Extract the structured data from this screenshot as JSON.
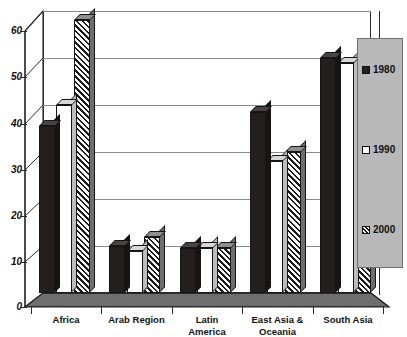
{
  "chart_data": {
    "type": "bar",
    "title": "",
    "subtitle": "",
    "xlabel": "",
    "ylabel": "",
    "ylim": [
      0,
      60
    ],
    "ytick_values": [
      0,
      10,
      20,
      30,
      40,
      50,
      60
    ],
    "ytick_labels": [
      "0",
      "10",
      "20",
      "30",
      "40",
      "50",
      "60"
    ],
    "grid": true,
    "legend_position": "right",
    "categories": [
      "Africa",
      "Arab Region",
      "Latin America",
      "East Asia & Oceania",
      "South Asia"
    ],
    "category_lines": [
      [
        "Africa"
      ],
      [
        "Arab Region"
      ],
      [
        "Latin",
        "America"
      ],
      [
        "East Asia &",
        "Oceania"
      ],
      [
        "South Asia"
      ]
    ],
    "series": [
      {
        "name": "1980",
        "values": [
          35.5,
          10,
          9.5,
          38.5,
          50
        ],
        "fill": "dark-dotted",
        "color": "#241f1f"
      },
      {
        "name": "1990",
        "values": [
          40,
          9,
          9.5,
          28,
          49
        ],
        "fill": "white",
        "color": "#ffffff"
      },
      {
        "name": "2000",
        "values": [
          58,
          12,
          9.5,
          30,
          48
        ],
        "fill": "diagonal-hatch",
        "color": "#ffffff"
      }
    ]
  },
  "legend": {
    "entries": [
      {
        "label": "1980"
      },
      {
        "label": "1990"
      },
      {
        "label": "2000"
      }
    ]
  },
  "colors": {
    "frame": "#2b2b2b",
    "grid": "#8a8a8a",
    "legend_panel": "#b8b8b8",
    "floor": "#6e6e6e",
    "background": "#ffffff"
  }
}
